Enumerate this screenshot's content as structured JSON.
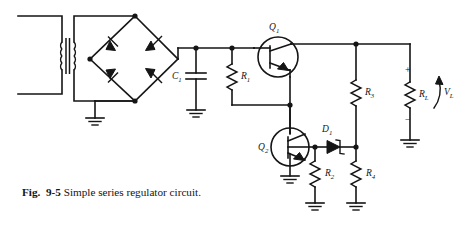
{
  "figure": {
    "number_prefix": "Fig.",
    "number": "9-5",
    "caption": "Simple series regulator circuit.",
    "full_caption": "Fig. 9-5 Simple series regulator circuit."
  },
  "diagram": {
    "type": "schematic",
    "title": "Simple series regulator circuit",
    "ink_color": "#151515",
    "background": "#ffffff",
    "components": [
      {
        "id": "T1",
        "kind": "transformer",
        "label": "",
        "note": "iron-core step-down transformer, left side"
      },
      {
        "id": "D_bridge_TL",
        "kind": "diode",
        "label": "",
        "note": "bridge rectifier top-left arm"
      },
      {
        "id": "D_bridge_TR",
        "kind": "diode",
        "label": "",
        "note": "bridge rectifier top-right arm"
      },
      {
        "id": "D_bridge_BL",
        "kind": "diode",
        "label": "",
        "note": "bridge rectifier bottom-left arm"
      },
      {
        "id": "D_bridge_BR",
        "kind": "diode",
        "label": "",
        "note": "bridge rectifier bottom-right arm"
      },
      {
        "id": "C1",
        "kind": "capacitor",
        "label": "C",
        "subscript": "1"
      },
      {
        "id": "R1",
        "kind": "resistor",
        "label": "R",
        "subscript": "1"
      },
      {
        "id": "Q1",
        "kind": "transistor-npn",
        "label": "Q",
        "subscript": "1"
      },
      {
        "id": "Q2",
        "kind": "transistor-npn",
        "label": "Q",
        "subscript": "2"
      },
      {
        "id": "D1",
        "kind": "zener-diode",
        "label": "D",
        "subscript": "1"
      },
      {
        "id": "R2",
        "kind": "resistor",
        "label": "R",
        "subscript": "2"
      },
      {
        "id": "R3",
        "kind": "resistor",
        "label": "R",
        "subscript": "3"
      },
      {
        "id": "R4",
        "kind": "resistor",
        "label": "R",
        "subscript": "4"
      },
      {
        "id": "RL",
        "kind": "resistor-load",
        "label": "R",
        "subscript": "L"
      },
      {
        "id": "VL",
        "kind": "voltage-label",
        "label": "V",
        "subscript": "L"
      }
    ],
    "labels": {
      "C1": {
        "main": "C",
        "sub": "1"
      },
      "R1": {
        "main": "R",
        "sub": "1"
      },
      "R2": {
        "main": "R",
        "sub": "2"
      },
      "R3": {
        "main": "R",
        "sub": "3"
      },
      "R4": {
        "main": "R",
        "sub": "4"
      },
      "RL": {
        "main": "R",
        "sub": "L"
      },
      "Q1": {
        "main": "Q",
        "sub": "1"
      },
      "Q2": {
        "main": "Q",
        "sub": "2"
      },
      "D1": {
        "main": "D",
        "sub": "1"
      },
      "VL": {
        "main": "V",
        "sub": "L"
      }
    },
    "polarity": {
      "plus": "+",
      "minus": "−"
    },
    "ground_count": 7
  }
}
